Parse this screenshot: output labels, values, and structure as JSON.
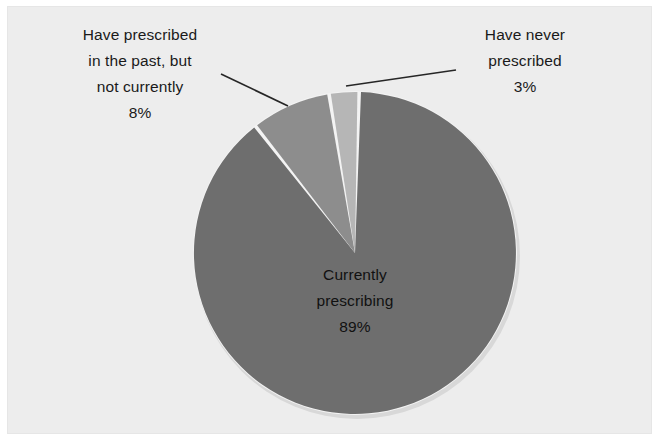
{
  "figure": {
    "background_color": "#ffffff",
    "panel_color": "#ededed"
  },
  "chart_data": {
    "type": "pie",
    "title": "",
    "subtitle": "",
    "xlabel": "",
    "ylabel": "",
    "legend_position": "none",
    "grid": false,
    "units": "percent",
    "start_angle_deg": 1.5,
    "direction": "clockwise",
    "categories": [
      "Currently prescribing",
      "Have prescribed in the past, but not currently",
      "Have never prescribed"
    ],
    "values": [
      89,
      8,
      3
    ],
    "value_labels": [
      "89%",
      "8%",
      "3%"
    ],
    "colors": [
      "#6e6e6e",
      "#8d8d8d",
      "#b6b6b6"
    ],
    "slice_angles_deg": [
      320.4,
      28.8,
      10.8
    ],
    "slices": [
      {
        "label": "Currently prescribing",
        "value": 89,
        "value_label": "89%",
        "color": "#6e6e6e",
        "label_placement": "inside"
      },
      {
        "label": "Have prescribed in the past, but not currently",
        "value": 8,
        "value_label": "8%",
        "color": "#8d8d8d",
        "label_placement": "outside-left",
        "has_leader_line": true
      },
      {
        "label": "Have never prescribed",
        "value": 3,
        "value_label": "3%",
        "color": "#b6b6b6",
        "label_placement": "outside-right",
        "has_leader_line": true
      }
    ]
  },
  "labels": {
    "past": {
      "line1": "Have prescribed",
      "line2": "in the past, but",
      "line3": "not currently",
      "percent": "8%"
    },
    "never": {
      "line1": "Have never",
      "line2": "prescribed",
      "percent": "3%"
    },
    "current": {
      "line1": "Currently",
      "line2": "prescribing",
      "percent": "89%"
    }
  }
}
